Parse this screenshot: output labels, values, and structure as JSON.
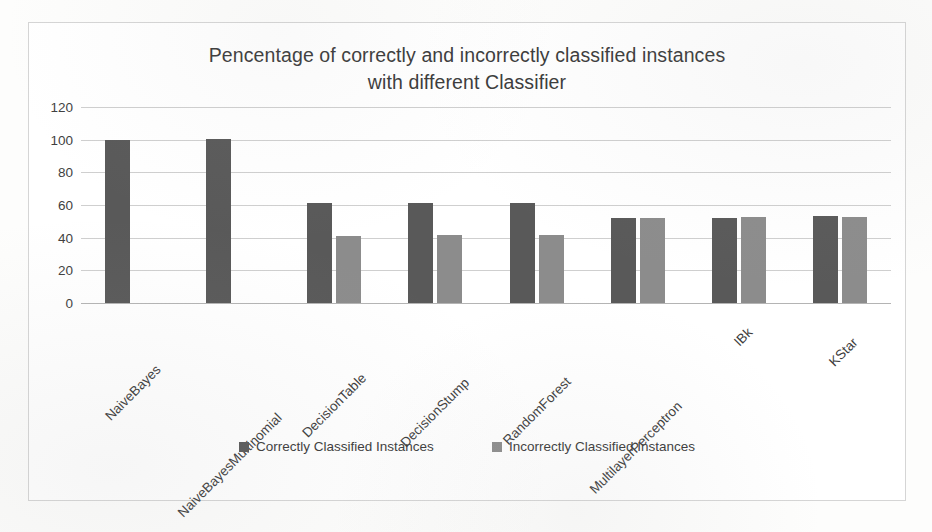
{
  "chart_data": {
    "type": "bar",
    "title": "Pencentage of correctly and incorrectly classified instances\nwith different Classifier",
    "xlabel": "",
    "ylabel": "",
    "ylim": [
      0,
      120
    ],
    "yticks": [
      120,
      100,
      80,
      60,
      40,
      20,
      0
    ],
    "grid": true,
    "legend_position": "bottom",
    "categories": [
      "NaiveBayes",
      "NaiveBayesMultinomial",
      "DecisionTable",
      "DecisionStump",
      "RandomForest",
      "MultilayerPerceptron",
      "IBk",
      "KStar"
    ],
    "series": [
      {
        "name": "Correctly Classified Instances",
        "color": "#595959",
        "values": [
          100,
          100.5,
          61,
          61,
          61.5,
          52,
          52,
          53
        ]
      },
      {
        "name": "Incorrectly Classified Instances",
        "color": "#8c8c8c",
        "values": [
          0,
          0,
          41,
          41.5,
          41.5,
          52,
          52.5,
          52.5
        ]
      }
    ]
  },
  "legend": {
    "items": [
      {
        "label": "Correctly Classified Instances",
        "swatch": "series-correct"
      },
      {
        "label": "Incorrectly Classified Instances",
        "swatch": "series-incorrect"
      }
    ]
  }
}
